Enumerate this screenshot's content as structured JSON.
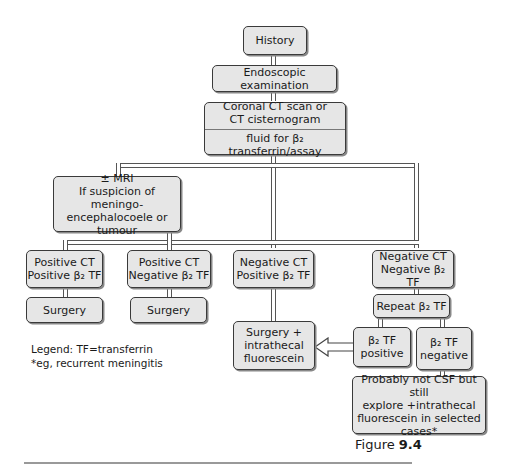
{
  "nodes": {
    "history": "History",
    "endoscopic": "Endoscopic examination",
    "ct_line1": "Coronal CT scan or",
    "ct_line2": "CT cisternogram",
    "ct_fluid": "fluid for β₂ transferrin/assay",
    "mri_line1": "± MRI",
    "mri_line2": "If suspicion of meningo-",
    "mri_line3": "encephalocoele or tumour",
    "pos_ct_pos_line1": "Positive CT",
    "pos_ct_pos_line2": "Positive β₂ TF",
    "pos_ct_neg_line1": "Positive CT",
    "pos_ct_neg_line2": "Negative β₂ TF",
    "neg_ct_pos_line1": "Negative CT",
    "neg_ct_pos_line2": "Positive β₂ TF",
    "neg_ct_neg_line1": "Negative CT",
    "neg_ct_neg_line2": "Negative β₂ TF",
    "surgery1": "Surgery",
    "surgery2": "Surgery",
    "surgery_fluor_line1": "Surgery +",
    "surgery_fluor_line2": "intrathecal",
    "surgery_fluor_line3": "fluorescein",
    "repeat": "Repeat β₂ TF",
    "tf_pos_line1": "β₂ TF",
    "tf_pos_line2": "positive",
    "tf_neg_line1": "β₂ TF",
    "tf_neg_line2": "negative",
    "probably_line1": "Probably not CSF but still",
    "probably_line2": "explore +intrathecal",
    "probably_line3": "fluorescein in selected",
    "probably_line4": "cases*"
  },
  "legend": {
    "line1": "Legend: TF=transferrin",
    "line2": "*eg, recurrent meningitis"
  },
  "figure": {
    "prefix": "Figure ",
    "number": "9.4"
  }
}
